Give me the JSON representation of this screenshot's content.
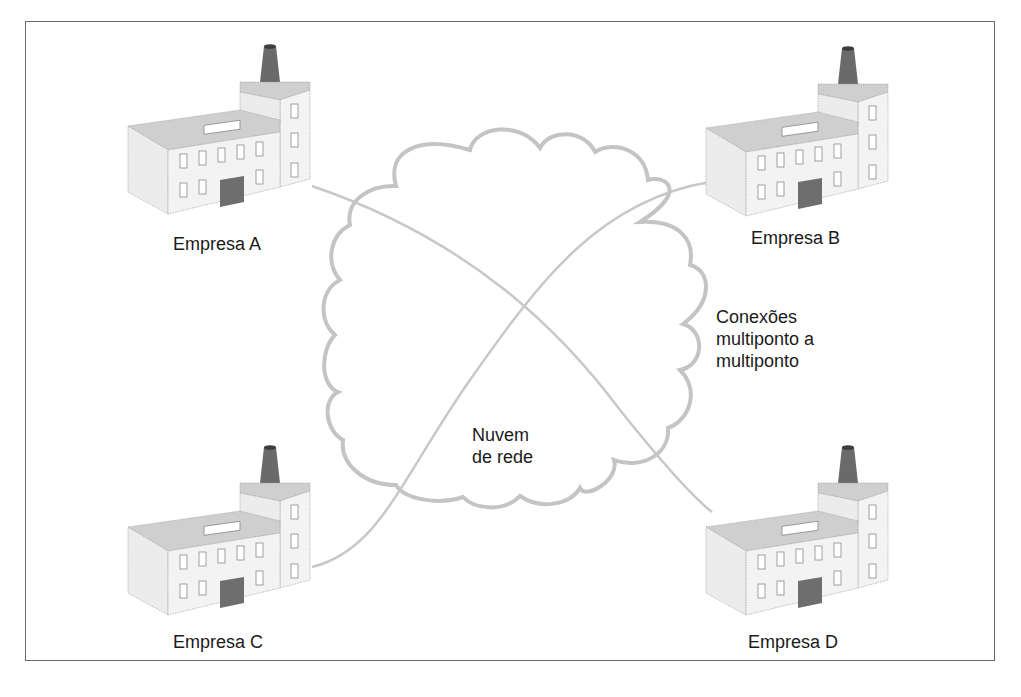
{
  "diagram": {
    "cloud_label_lines": [
      "Nuvem",
      "de rede"
    ],
    "connections_label_lines": [
      "Conexões",
      "multiponto a",
      "multiponto"
    ],
    "nodes": [
      {
        "id": "A",
        "label": "Empresa A",
        "x": 128,
        "y": 42
      },
      {
        "id": "B",
        "label": "Empresa B",
        "x": 706,
        "y": 44
      },
      {
        "id": "C",
        "label": "Empresa C",
        "x": 128,
        "y": 443
      },
      {
        "id": "D",
        "label": "Empresa D",
        "x": 706,
        "y": 443
      }
    ],
    "connections": [
      {
        "from": "A",
        "to": "D"
      },
      {
        "from": "C",
        "to": "B"
      }
    ],
    "colors": {
      "frame": "#6a6a6a",
      "cloud_stroke": "#c4c4c4",
      "link_stroke": "#c8c8c8",
      "wall": "#f1f1f1",
      "roof": "#cfcfcf",
      "door": "#6e6e6e",
      "chimney": "#6a6a6a"
    }
  }
}
